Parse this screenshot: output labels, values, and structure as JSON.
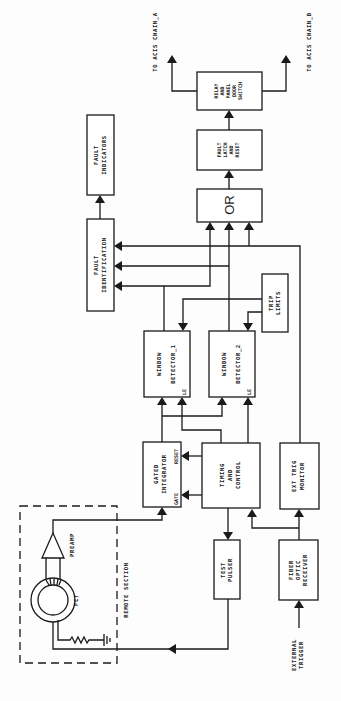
{
  "diagram": {
    "orientation": "rotated-90-ccw",
    "blocks": {
      "fault_indicators": [
        "FAULT",
        "INDICATORS"
      ],
      "fault_identification": [
        "FAULT",
        "IDENTIFICATION"
      ],
      "or_gate": [
        "OR"
      ],
      "fault_latch": [
        "FAULT",
        "LATCH",
        "AND",
        "RESET"
      ],
      "relay": [
        "RELAY",
        "AND",
        "PANEL",
        "DOOR",
        "SWITCH"
      ],
      "window_detector_1": [
        "WINDOW",
        "DETECTOR_1"
      ],
      "window_detector_2": [
        "WINDOW",
        "DETECTOR_2"
      ],
      "trip_limits": [
        "TRIP",
        "LIMITS"
      ],
      "gated_integrator": [
        "GATED",
        "INTEGRATOR"
      ],
      "timing_control": [
        "TIMING",
        "AND",
        "CONTROL"
      ],
      "ext_trig_monitor": [
        "EXT TRIG",
        "MONITOR"
      ],
      "test_pulser": [
        "TEST",
        "PULSER"
      ],
      "fiber_optic_receiver": [
        "FIBER",
        "OPTIC",
        "RECEIVER"
      ]
    },
    "ports": {
      "le": "LE",
      "gate": "GATE",
      "reset": "RESET"
    },
    "components": {
      "preamp": "PREAMP",
      "fct": "FCT",
      "remote_section": "REMOTE SECTION"
    },
    "outputs": {
      "chain_a": "TO ACIS CHAIN_A",
      "chain_b": "TO ACIS CHAIN_B"
    },
    "inputs": {
      "external_trigger": [
        "EXTERNAL",
        "TRIGGER"
      ]
    }
  }
}
